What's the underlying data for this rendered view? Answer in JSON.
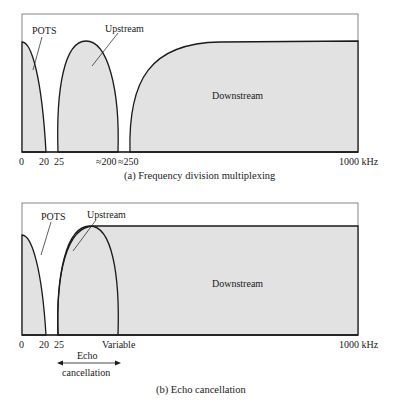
{
  "panel_a": {
    "labels": {
      "pots": "POTS",
      "upstream": "Upstream",
      "downstream": "Downstream"
    },
    "ticks": [
      "0",
      "20",
      "25",
      "≈200",
      "≈250",
      "1000 kHz"
    ],
    "caption": "(a) Frequency division multiplexing"
  },
  "panel_b": {
    "labels": {
      "pots": "POTS",
      "upstream": "Upstream",
      "downstream": "Downstream",
      "echo_line1": "Echo",
      "echo_line2": "cancellation"
    },
    "ticks": [
      "0",
      "20",
      "25",
      "Variable",
      "1000 kHz"
    ],
    "caption": "(b) Echo cancellation"
  },
  "colors": {
    "fill": "#e2e2e2",
    "stroke": "#1a1a1a",
    "frame": "#6a6a6a"
  }
}
